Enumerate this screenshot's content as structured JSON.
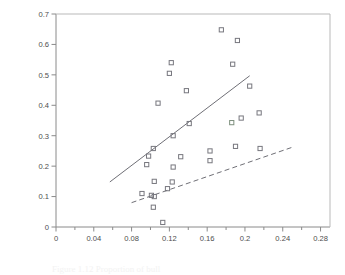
{
  "figure": {
    "caption_partial": "Figure 1.12 Proportion of bull"
  },
  "chart_data": {
    "type": "scatter",
    "title": "",
    "xlabel": "Proportion of bulls in herd",
    "ylabel": "Proportion of bull mortalities",
    "xlim": [
      0,
      0.29
    ],
    "ylim": [
      0,
      0.7
    ],
    "grid": false,
    "legend": "none",
    "xticks": [
      0,
      0.02,
      0.04,
      0.06,
      0.08,
      0.1,
      0.12,
      0.14,
      0.16,
      0.18,
      0.2,
      0.22,
      0.24,
      0.26,
      0.28
    ],
    "xtick_labels": [
      "0",
      "",
      "0.04",
      "",
      "0.08",
      "",
      "0.12",
      "",
      "0.16",
      "",
      "0.2",
      "",
      "0.24",
      "",
      "0.28"
    ],
    "yticks": [
      0,
      0.1,
      0.2,
      0.3,
      0.4,
      0.5,
      0.6,
      0.7
    ],
    "ytick_labels": [
      "0",
      "0.1",
      "0.2",
      "0.3",
      "0.4",
      "0.5",
      "0.6",
      "0.7"
    ],
    "marker": "open-square",
    "points": [
      {
        "x": 0.175,
        "y": 0.648
      },
      {
        "x": 0.192,
        "y": 0.613
      },
      {
        "x": 0.122,
        "y": 0.54
      },
      {
        "x": 0.187,
        "y": 0.535
      },
      {
        "x": 0.12,
        "y": 0.505
      },
      {
        "x": 0.205,
        "y": 0.463
      },
      {
        "x": 0.138,
        "y": 0.448
      },
      {
        "x": 0.108,
        "y": 0.407
      },
      {
        "x": 0.215,
        "y": 0.375
      },
      {
        "x": 0.196,
        "y": 0.358
      },
      {
        "x": 0.141,
        "y": 0.34
      },
      {
        "x": 0.124,
        "y": 0.3
      },
      {
        "x": 0.103,
        "y": 0.258
      },
      {
        "x": 0.216,
        "y": 0.258
      },
      {
        "x": 0.19,
        "y": 0.265
      },
      {
        "x": 0.163,
        "y": 0.25
      },
      {
        "x": 0.098,
        "y": 0.233
      },
      {
        "x": 0.132,
        "y": 0.231
      },
      {
        "x": 0.163,
        "y": 0.218
      },
      {
        "x": 0.096,
        "y": 0.205
      },
      {
        "x": 0.124,
        "y": 0.197
      },
      {
        "x": 0.104,
        "y": 0.15
      },
      {
        "x": 0.123,
        "y": 0.148
      },
      {
        "x": 0.118,
        "y": 0.126
      },
      {
        "x": 0.091,
        "y": 0.11
      },
      {
        "x": 0.101,
        "y": 0.104
      },
      {
        "x": 0.104,
        "y": 0.1
      },
      {
        "x": 0.103,
        "y": 0.065
      },
      {
        "x": 0.113,
        "y": 0.015
      }
    ],
    "tinted_points": [
      {
        "x": 0.186,
        "y": 0.343
      }
    ],
    "trend_lines": [
      {
        "name": "solid-fit-line",
        "style": "solid",
        "x0": 0.057,
        "y0": 0.148,
        "x1": 0.205,
        "y1": 0.497
      },
      {
        "name": "dashed-fit-line",
        "style": "dashed",
        "x0": 0.08,
        "y0": 0.08,
        "x1": 0.25,
        "y1": 0.262
      }
    ]
  }
}
